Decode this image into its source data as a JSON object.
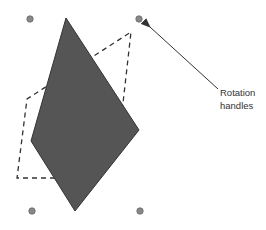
{
  "annotation": {
    "line1": "Rotation",
    "line2": "handles"
  },
  "colors": {
    "shape_fill": "#555555",
    "shape_stroke": "#333333",
    "outline": "#333333",
    "handle": "#888888",
    "arrow": "#333333"
  }
}
